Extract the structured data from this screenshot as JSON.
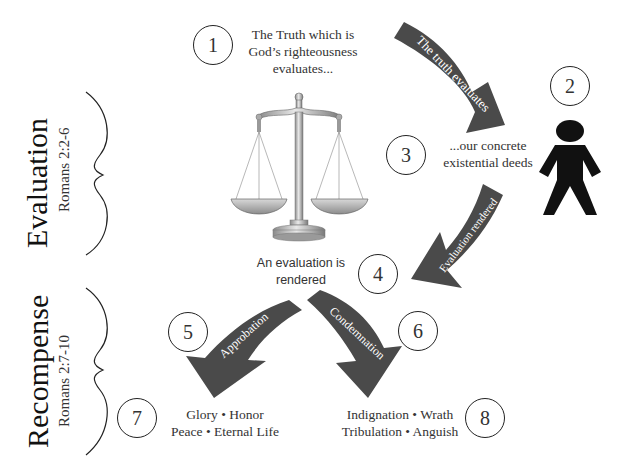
{
  "sections": [
    {
      "title": "Evaluation",
      "reference": "Romans 2:2-6"
    },
    {
      "title": "Recompense",
      "reference": "Romans 2:7-10"
    }
  ],
  "steps": [
    {
      "number": "1",
      "text_lines": [
        "The Truth which is",
        "God’s righteousness",
        "evaluates..."
      ]
    },
    {
      "number": "2",
      "icon": "person-icon"
    },
    {
      "number": "3",
      "text_lines": [
        "...our concrete",
        "existential deeds"
      ]
    },
    {
      "number": "4",
      "text_lines": [
        "An evaluation is",
        "rendered"
      ]
    },
    {
      "number": "5"
    },
    {
      "number": "6"
    },
    {
      "number": "7",
      "text_lines": [
        "Glory • Honor",
        "Peace • Eternal Life"
      ]
    },
    {
      "number": "8",
      "text_lines": [
        "Indignation • Wrath",
        "Tribulation • Anguish"
      ]
    }
  ],
  "arrows": [
    {
      "label": "The truth evaluates"
    },
    {
      "label": "Evaluation rendered"
    },
    {
      "label": "Approbation"
    },
    {
      "label": "Condemnation"
    }
  ],
  "colors": {
    "arrow_fill": "#4a4a4a",
    "arrow_text": "#ffffff",
    "line": "#222222",
    "figure": "#111111"
  }
}
